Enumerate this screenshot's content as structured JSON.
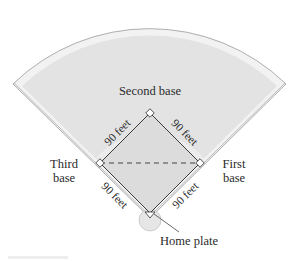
{
  "diagram": {
    "bases": {
      "second": "Second base",
      "third_line1": "Third",
      "third_line2": "base",
      "first_line1": "First",
      "first_line2": "base",
      "home": "Home plate"
    },
    "edges": {
      "home_to_third": "90 feet",
      "third_to_second": "90 feet",
      "second_to_first": "90 feet",
      "first_to_home": "90 feet"
    },
    "colors": {
      "outfield_border": "#f0f0f0",
      "outfield_fill": "#e2e2e2",
      "infield_arc": "#ececec",
      "diamond_fill": "#dedede",
      "line": "#3a3a3a",
      "text": "#2a2a2a"
    }
  }
}
